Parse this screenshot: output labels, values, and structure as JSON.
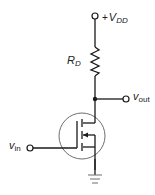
{
  "diagram": {
    "type": "circuit-schematic",
    "colors": {
      "wire": "#1a1a1a",
      "transistor_body": "#6e6e6e",
      "background": "#ffffff"
    },
    "labels": {
      "supply": {
        "prefix": "+",
        "main": "V",
        "sub": "DD"
      },
      "resistor": {
        "main": "R",
        "sub": "D"
      },
      "output": {
        "main": "v",
        "sub": "out"
      },
      "input": {
        "main": "v",
        "sub": "in"
      }
    },
    "components": [
      {
        "id": "vdd-terminal",
        "kind": "terminal",
        "label": "+V_DD"
      },
      {
        "id": "rd",
        "kind": "resistor",
        "label": "R_D"
      },
      {
        "id": "drain-node",
        "kind": "junction"
      },
      {
        "id": "vout-terminal",
        "kind": "terminal",
        "label": "v_out"
      },
      {
        "id": "m1",
        "kind": "nmos-transistor"
      },
      {
        "id": "vin-terminal",
        "kind": "terminal",
        "label": "v_in"
      },
      {
        "id": "gnd",
        "kind": "ground"
      }
    ]
  }
}
